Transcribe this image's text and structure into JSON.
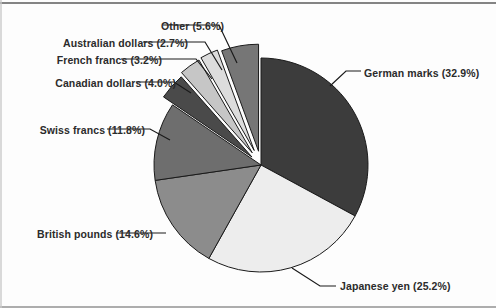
{
  "chart_data": {
    "type": "pie",
    "title": "",
    "subtitle": "",
    "xlabel": "",
    "ylabel": "",
    "legend_position": "none",
    "grid": false,
    "labels_show_percent": true,
    "total_percent": 100.0,
    "categories": [
      "German marks",
      "Japanese yen",
      "British pounds",
      "Swiss francs",
      "Canadian dollars",
      "French francs",
      "Australian dollars",
      "Other"
    ],
    "values": [
      32.9,
      25.2,
      14.6,
      11.8,
      4.0,
      3.2,
      2.7,
      5.6
    ],
    "colors": [
      "#3c3c3c",
      "#ededed",
      "#8c8c8c",
      "#6e6e6e",
      "#4a4a4a",
      "#c6c6c6",
      "#dcdcdc",
      "#767676"
    ],
    "slices": [
      {
        "name": "German marks",
        "value": 32.9,
        "label": "German marks (32.9%)",
        "color": "#3c3c3c"
      },
      {
        "name": "Japanese yen",
        "value": 25.2,
        "label": "Japanese yen (25.2%)",
        "color": "#ededed"
      },
      {
        "name": "British pounds",
        "value": 14.6,
        "label": "British pounds (14.6%)",
        "color": "#8c8c8c"
      },
      {
        "name": "Swiss francs",
        "value": 11.8,
        "label": "Swiss francs (11.8%)",
        "color": "#6e6e6e"
      },
      {
        "name": "Canadian dollars",
        "value": 4.0,
        "label": "Canadian dollars (4.0%)",
        "color": "#4a4a4a"
      },
      {
        "name": "French francs",
        "value": 3.2,
        "label": "French francs (3.2%)",
        "color": "#c6c6c6"
      },
      {
        "name": "Australian dollars",
        "value": 2.7,
        "label": "Australian dollars (2.7%)",
        "color": "#dcdcdc"
      },
      {
        "name": "Other",
        "value": 5.6,
        "label": "Other (5.6%)",
        "color": "#767676"
      }
    ]
  },
  "labels": {
    "german_marks": "German marks (32.9%)",
    "japanese_yen": "Japanese yen (25.2%)",
    "british_pounds": "British pounds (14.6%)",
    "swiss_francs": "Swiss francs (11.8%)",
    "canadian_dollars": "Canadian dollars (4.0%)",
    "french_francs": "French francs (3.2%)",
    "australian_dollars": "Australian dollars (2.7%)",
    "other": "Other (5.6%)"
  },
  "style": {
    "background": "#fdfdfd",
    "text_color": "#2b2b2b",
    "outline_color": "#1a1a1a",
    "leader_color": "#1a1a1a"
  },
  "geometry": {
    "center_x": 261,
    "center_y": 165,
    "radius": 107,
    "start_angle_deg": -90,
    "direction": "clockwise"
  }
}
